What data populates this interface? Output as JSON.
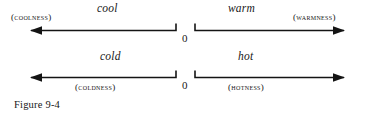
{
  "figure": {
    "caption": "Figure 9-4",
    "ink_color": "#141414",
    "background_color": "#ffffff"
  },
  "scales": [
    {
      "name": "temperature-intensity-scale",
      "zero_label": "0",
      "negative": {
        "term": "cool",
        "quality_label": "(COOLNESS)",
        "direction": "left"
      },
      "positive": {
        "term": "warm",
        "quality_label": "(WARMNESS)",
        "direction": "right"
      }
    },
    {
      "name": "temperature-extreme-scale",
      "zero_label": "0",
      "negative": {
        "term": "cold",
        "quality_label": "(COLDNESS)",
        "direction": "left"
      },
      "positive": {
        "term": "hot",
        "quality_label": "(HOTNESS)",
        "direction": "right"
      }
    }
  ]
}
